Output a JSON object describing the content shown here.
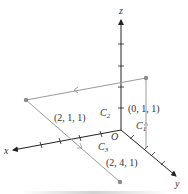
{
  "figure": {
    "axes": {
      "x_label": "x",
      "y_label": "y",
      "z_label": "z",
      "origin_label": "O"
    },
    "points": [
      {
        "label": "(0, 1, 1)",
        "coords": [
          0,
          1,
          1
        ]
      },
      {
        "label": "(2, 1, 1)",
        "coords": [
          2,
          1,
          1
        ]
      },
      {
        "label": "(2, 4, 1)",
        "coords": [
          2,
          4,
          1
        ]
      }
    ],
    "curves": [
      {
        "name": "C",
        "sub": "1",
        "description": "vertical segment from (0,1,0) up to (0,1,1)"
      },
      {
        "name": "C",
        "sub": "2",
        "description": "segment from (0,1,1) to (2,1,1)"
      },
      {
        "name": "C",
        "sub": "3",
        "description": "segment from (2,1,1) to (2,4,1)"
      }
    ],
    "colors": {
      "axis": "#222222",
      "path": "#9a9a9a",
      "point": "#8a8a8a",
      "text": "#333333"
    }
  }
}
